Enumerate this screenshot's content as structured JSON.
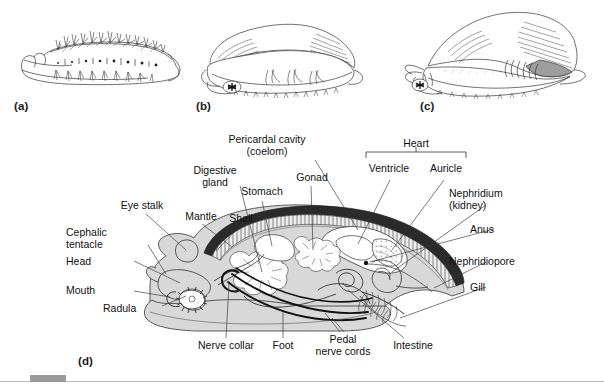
{
  "figure": {
    "kind": "scientific-illustration",
    "background_color": "#ffffff",
    "ink_color": "#111111",
    "body_fill": "#d8d8d8",
    "shell_color": "#2b2b2b",
    "mantle_fill": "#e8e8e8",
    "organ_fill": "#ffffff"
  },
  "panels": [
    {
      "id": "a",
      "letter": "(a)",
      "caption_x": 14,
      "caption_y": 100
    },
    {
      "id": "b",
      "letter": "(b)",
      "caption_x": 196,
      "caption_y": 100
    },
    {
      "id": "c",
      "letter": "(c)",
      "caption_x": 420,
      "caption_y": 100
    },
    {
      "id": "d",
      "letter": "(d)",
      "caption_x": 78,
      "caption_y": 355
    }
  ],
  "labels": {
    "bracket_group": {
      "name": "Heart",
      "children": [
        "Ventricle",
        "Auricle"
      ]
    },
    "items": [
      {
        "text": "Pericardal cavity",
        "x": 267,
        "y": 138,
        "align": "center",
        "line2": "(coelom)"
      },
      {
        "text": "Heart",
        "x": 415,
        "y": 143,
        "align": "center"
      },
      {
        "text": "Ventricle",
        "x": 388,
        "y": 171,
        "align": "center"
      },
      {
        "text": "Auricle",
        "x": 443,
        "y": 171,
        "align": "center"
      },
      {
        "text": "Digestive",
        "x": 213,
        "y": 172,
        "align": "center",
        "line2": "gland"
      },
      {
        "text": "Gonad",
        "x": 311,
        "y": 177,
        "align": "center"
      },
      {
        "text": "Stomach",
        "x": 262,
        "y": 192,
        "align": "center"
      },
      {
        "text": "Nephridium",
        "x": 489,
        "y": 192,
        "align": "left",
        "line2": "(kidney)"
      },
      {
        "text": "Eye stalk",
        "x": 141,
        "y": 205,
        "align": "center"
      },
      {
        "text": "Mantle",
        "x": 202,
        "y": 215,
        "align": "center"
      },
      {
        "text": "Shell",
        "x": 240,
        "y": 217,
        "align": "center"
      },
      {
        "text": "Anus",
        "x": 497,
        "y": 229,
        "align": "left"
      },
      {
        "text": "Cephalic",
        "x": 99,
        "y": 232,
        "align": "left",
        "line2": "tentacle"
      },
      {
        "text": "Nephridiopore",
        "x": 489,
        "y": 262,
        "align": "left"
      },
      {
        "text": "Head",
        "x": 99,
        "y": 261,
        "align": "left"
      },
      {
        "text": "Gill",
        "x": 489,
        "y": 287,
        "align": "left"
      },
      {
        "text": "Mouth",
        "x": 99,
        "y": 288,
        "align": "left"
      },
      {
        "text": "Radula",
        "x": 124,
        "y": 309,
        "align": "left"
      },
      {
        "text": "Nerve collar",
        "x": 214,
        "y": 345,
        "align": "center"
      },
      {
        "text": "Foot",
        "x": 283,
        "y": 345,
        "align": "center"
      },
      {
        "text": "Pedal",
        "x": 342,
        "y": 338,
        "align": "center",
        "line2": "nerve cords"
      },
      {
        "text": "Intestine",
        "x": 410,
        "y": 345,
        "align": "center"
      }
    ]
  },
  "label_texts": {
    "pericardal_cavity": "Pericardal cavity",
    "coelom": "(coelom)",
    "heart": "Heart",
    "ventricle": "Ventricle",
    "auricle": "Auricle",
    "digestive": "Digestive",
    "gland": "gland",
    "gonad": "Gonad",
    "stomach": "Stomach",
    "nephridium": "Nephridium",
    "kidney": "(kidney)",
    "eye_stalk": "Eye stalk",
    "mantle": "Mantle",
    "shell": "Shell",
    "anus": "Anus",
    "cephalic": "Cephalic",
    "tentacle": "tentacle",
    "nephridiopore": "Nephridiopore",
    "head": "Head",
    "gill": "Gill",
    "mouth": "Mouth",
    "radula": "Radula",
    "nerve_collar": "Nerve collar",
    "foot": "Foot",
    "pedal": "Pedal",
    "nerve_cords": "nerve cords",
    "intestine": "Intestine",
    "letter_a": "(a)",
    "letter_b": "(b)",
    "letter_c": "(c)",
    "letter_d": "(d)"
  },
  "footer": {
    "rule_color": "#b5b5b5",
    "tab_color": "#9a9a9a"
  }
}
